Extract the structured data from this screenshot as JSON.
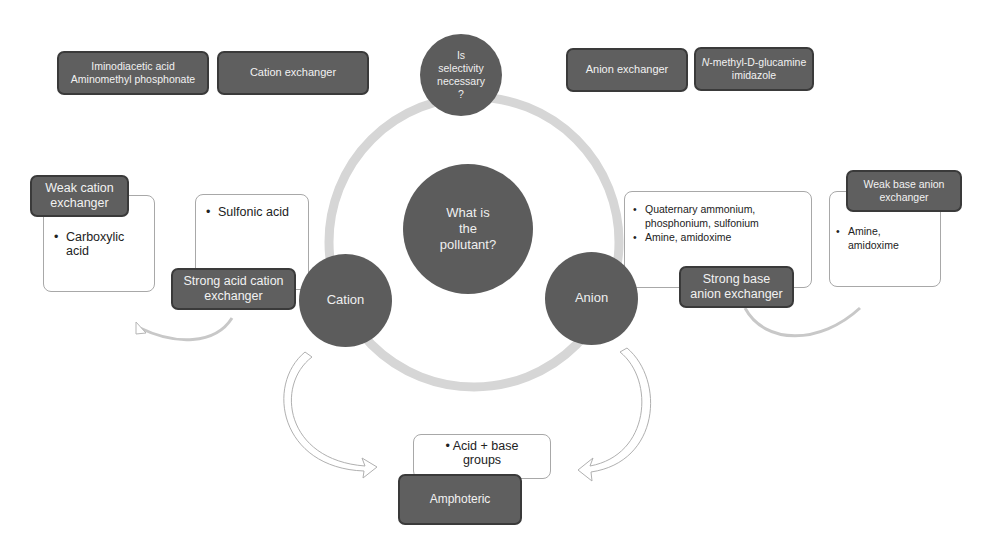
{
  "center": {
    "question": "What is the pollutant?",
    "lines": [
      "What is",
      "the",
      "pollutant?"
    ]
  },
  "top_node": {
    "lines": [
      "Is",
      "selectivity",
      "necessary",
      "?"
    ]
  },
  "cation_node": {
    "label": "Cation"
  },
  "anion_node": {
    "label": "Anion"
  },
  "top_left": {
    "chelating_box": {
      "lines": [
        "Iminodiacetic acid",
        "Aminomethyl phosphonate"
      ]
    },
    "cation_exchanger_box": {
      "label": "Cation exchanger"
    }
  },
  "top_right": {
    "anion_exchanger_box": {
      "label": "Anion exchanger"
    },
    "chelating_box": {
      "line1": "N-methyl-D-glucamine",
      "line1_italic_prefix": "N",
      "line1_rest": "-methyl-D-glucamine",
      "line2": "imidazole"
    }
  },
  "weak_cation": {
    "title_lines": [
      "Weak cation",
      "exchanger"
    ],
    "items": [
      "Carboxylic acid"
    ],
    "item_lines": [
      "Carboxylic",
      "acid"
    ]
  },
  "strong_acid_cation": {
    "title_lines": [
      "Strong acid cation",
      "exchanger"
    ],
    "items": [
      "Sulfonic acid"
    ]
  },
  "strong_base_anion": {
    "title_lines": [
      "Strong base",
      "anion exchanger"
    ],
    "items": [
      "Quaternary ammonium, phosphonium, sulfonium",
      "Amine, amidoxime"
    ],
    "item1_lines": [
      "Quaternary ammonium,",
      "phosphonium, sulfonium"
    ]
  },
  "weak_base_anion": {
    "title_lines": [
      "Weak base anion",
      "exchanger"
    ],
    "items": [
      "Amine, amidoxime"
    ],
    "item_lines": [
      "Amine,",
      "amidoxime"
    ]
  },
  "amphoteric": {
    "title": "Amphoteric",
    "items": [
      "Acid + base groups"
    ],
    "item_lines": [
      "Acid + base",
      "groups"
    ]
  },
  "colors": {
    "node_fill": "#5c5c5c",
    "box_fill": "#5f5f5f",
    "box_border": "#3a3a3a",
    "ring": "#d4d4d4",
    "arrow_stroke": "#b5b5b5"
  }
}
